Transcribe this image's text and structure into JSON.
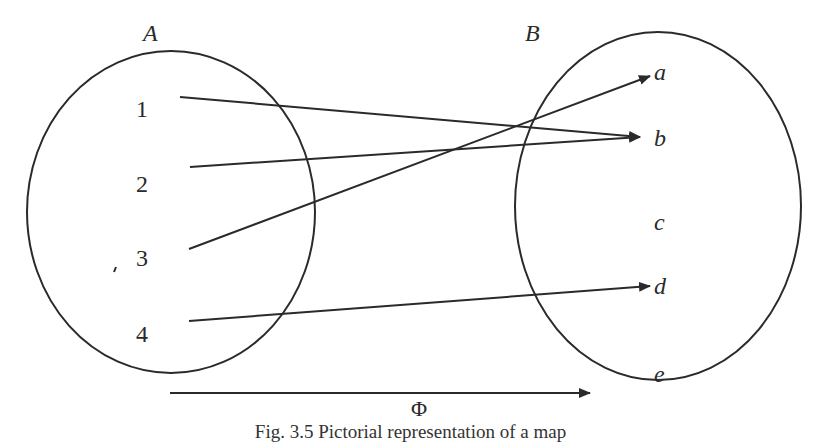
{
  "figure": {
    "set_a": {
      "label": "A",
      "elements": [
        "1",
        "2",
        "3",
        "4"
      ]
    },
    "set_b": {
      "label": "B",
      "elements": [
        "a",
        "b",
        "c",
        "d",
        "e"
      ]
    },
    "mapping_label": "Φ",
    "mappings": [
      {
        "from": "1",
        "to": "b"
      },
      {
        "from": "2",
        "to": "b"
      },
      {
        "from": "3",
        "to": "a"
      },
      {
        "from": "4",
        "to": "d"
      }
    ],
    "caption": "Fig. 3.5 Pictorial representation of a map"
  },
  "colors": {
    "ink": "#2a2a2a",
    "background": "#ffffff"
  }
}
